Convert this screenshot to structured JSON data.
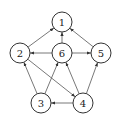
{
  "diagram": {
    "type": "directed-graph",
    "node_radius": 10,
    "colors": {
      "stroke": "#333333",
      "edge": "#555555",
      "fill": "#ffffff",
      "text": "#222222"
    },
    "nodes": [
      {
        "id": "1",
        "label": "1",
        "x": 62,
        "y": 22
      },
      {
        "id": "2",
        "label": "2",
        "x": 20,
        "y": 53
      },
      {
        "id": "6",
        "label": "6",
        "x": 62,
        "y": 53
      },
      {
        "id": "5",
        "label": "5",
        "x": 101,
        "y": 53
      },
      {
        "id": "3",
        "label": "3",
        "x": 41,
        "y": 103
      },
      {
        "id": "4",
        "label": "4",
        "x": 83,
        "y": 103
      }
    ],
    "edges": [
      {
        "from": "2",
        "to": "1"
      },
      {
        "from": "6",
        "to": "1"
      },
      {
        "from": "5",
        "to": "1"
      },
      {
        "from": "6",
        "to": "2"
      },
      {
        "from": "6",
        "to": "5"
      },
      {
        "from": "2",
        "to": "4"
      },
      {
        "from": "3",
        "to": "2"
      },
      {
        "from": "3",
        "to": "6"
      },
      {
        "from": "4",
        "to": "3"
      },
      {
        "from": "4",
        "to": "6"
      },
      {
        "from": "4",
        "to": "5"
      }
    ]
  }
}
